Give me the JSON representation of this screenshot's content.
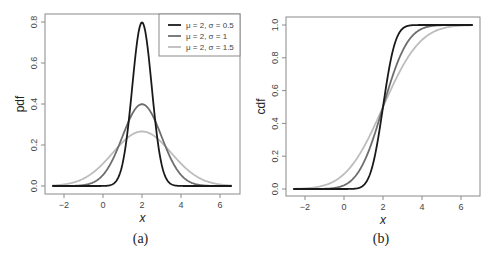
{
  "chart_data": [
    {
      "id": "a",
      "type": "line",
      "panel_label": "(a)",
      "title": "",
      "xlabel": "x",
      "ylabel": "pdf",
      "xlim": [
        -2.6,
        6.6
      ],
      "ylim": [
        0.0,
        0.8
      ],
      "xticks": [
        -2,
        0,
        2,
        4,
        6
      ],
      "xtick_labels": [
        "−2",
        "0",
        "2",
        "4",
        "6"
      ],
      "yticks": [
        0.0,
        0.2,
        0.4,
        0.6,
        0.8
      ],
      "ytick_labels": [
        "0.0",
        "0.2",
        "0.4",
        "0.6",
        "0.8"
      ],
      "grid": false,
      "legend_position": "top-right",
      "function": "normal_pdf",
      "series": [
        {
          "name": "μ = 2, σ = 0.5",
          "mu": 2,
          "sigma": 0.5,
          "color": "#1a1a1a",
          "peak": 0.798
        },
        {
          "name": "μ = 2, σ = 1",
          "mu": 2,
          "sigma": 1,
          "color": "#6e6e6e",
          "peak": 0.399
        },
        {
          "name": "μ = 2, σ = 1.5",
          "mu": 2,
          "sigma": 1.5,
          "color": "#bdbdbd",
          "peak": 0.266
        }
      ]
    },
    {
      "id": "b",
      "type": "line",
      "panel_label": "(b)",
      "title": "",
      "xlabel": "x",
      "ylabel": "cdf",
      "xlim": [
        -2.6,
        6.6
      ],
      "ylim": [
        0.0,
        1.0
      ],
      "xticks": [
        -2,
        0,
        2,
        4,
        6
      ],
      "xtick_labels": [
        "−2",
        "0",
        "2",
        "4",
        "6"
      ],
      "yticks": [
        0.0,
        0.2,
        0.4,
        0.6,
        0.8,
        1.0
      ],
      "ytick_labels": [
        "0.0",
        "0.2",
        "0.4",
        "0.6",
        "0.8",
        "1.0"
      ],
      "grid": false,
      "legend_position": "none",
      "function": "normal_cdf",
      "series": [
        {
          "name": "μ = 2, σ = 0.5",
          "mu": 2,
          "sigma": 0.5,
          "color": "#1a1a1a"
        },
        {
          "name": "μ = 2, σ = 1",
          "mu": 2,
          "sigma": 1,
          "color": "#6e6e6e"
        },
        {
          "name": "μ = 2, σ = 1.5",
          "mu": 2,
          "sigma": 1.5,
          "color": "#bdbdbd"
        }
      ]
    }
  ],
  "layout": {
    "panels": [
      {
        "frame": {
          "x": 45,
          "y": 14,
          "w": 195,
          "h": 180
        },
        "x0px": 103,
        "x2per": 39,
        "y0px": 186,
        "yunit_px": 205,
        "legend": {
          "x": 159,
          "y": 14,
          "w": 81,
          "h": 42
        }
      },
      {
        "frame": {
          "x": 286,
          "y": 17,
          "w": 194,
          "h": 179
        },
        "x0px": 344,
        "x2per": 39,
        "y0px": 189,
        "yunit_px": 164
      }
    ]
  }
}
